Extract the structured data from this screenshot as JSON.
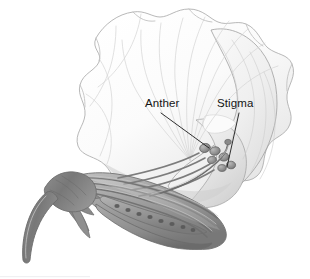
{
  "figure": {
    "kind": "botanical-illustration",
    "background_color": "#ffffff",
    "width": 310,
    "height": 279,
    "style": "grayscale pencil / airbrush rendering",
    "labels": [
      {
        "id": "anther",
        "text": "Anther",
        "text_x": 145,
        "text_y": 97,
        "leader_from": [
          161,
          113
        ],
        "leader_to": [
          209,
          148
        ]
      },
      {
        "id": "stigma",
        "text": "Stigma",
        "text_x": 217,
        "text_y": 97,
        "leader_from": [
          239,
          113
        ],
        "leader_to": [
          227,
          167
        ]
      }
    ],
    "colors": {
      "leader_line": "#1a1a1a",
      "label_text": "#141414",
      "petal_light": "#fcfcfc",
      "petal_shadow": "#d8d8d8",
      "petal_outline": "#9a9a9a",
      "keel_mid": "#9a9a9a",
      "keel_dark": "#6e6e6e",
      "stem_dark": "#7d7d7d",
      "ovule_dot": "#5a5a5a",
      "baseline_hint": "#f1f1f3"
    },
    "parts": [
      {
        "name": "standard-petal",
        "note": "large ruffled upper petal with radiating veins"
      },
      {
        "name": "wing-petal",
        "note": "right lobed petal forming the cup"
      },
      {
        "name": "keel",
        "note": "boat-shaped lower structure enclosing stamens"
      },
      {
        "name": "stamen-filaments",
        "note": "bundle of curved strands inside keel"
      },
      {
        "name": "anthers",
        "note": "cluster of small lobes at stamen tips"
      },
      {
        "name": "style-and-stigma",
        "note": "slender curved style ending at stigma"
      },
      {
        "name": "ovary",
        "note": "elongate body containing a row of ovules"
      },
      {
        "name": "ovules",
        "note": "row of small round dots inside ovary"
      },
      {
        "name": "calyx-sepals",
        "note": "pointed sepal lobes at flower base"
      },
      {
        "name": "peduncle",
        "note": "curving flower stalk descending to lower left"
      }
    ]
  }
}
